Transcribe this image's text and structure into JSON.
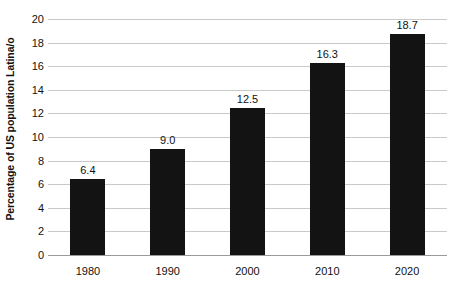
{
  "chart_data": {
    "type": "bar",
    "title": "",
    "xlabel": "",
    "ylabel": "Percentage of US population Latina/o",
    "categories": [
      "1980",
      "1990",
      "2000",
      "2010",
      "2020"
    ],
    "values": [
      6.4,
      9.0,
      12.5,
      16.3,
      18.7
    ],
    "value_labels": [
      "6.4",
      "9.0",
      "12.5",
      "16.3",
      "18.7"
    ],
    "ylim": [
      0,
      20
    ],
    "ytick_labels": [
      "0",
      "2",
      "4",
      "6",
      "8",
      "10",
      "12",
      "14",
      "16",
      "18",
      "20"
    ],
    "ytick_values": [
      0,
      2,
      4,
      6,
      8,
      10,
      12,
      14,
      16,
      18,
      20
    ],
    "grid": true,
    "grid_axis": "y",
    "legend": false,
    "bar_color": "#131313",
    "grid_color": "#c9c9c9",
    "axis_color": "#9a9a9a",
    "text_color": "#111111"
  }
}
